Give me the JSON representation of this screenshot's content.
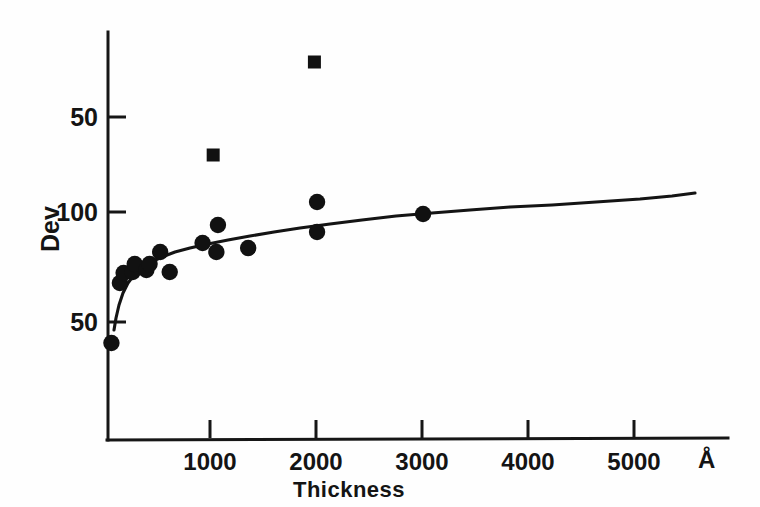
{
  "chart_data": {
    "type": "scatter",
    "title": "",
    "xlabel": "Thickness",
    "ylabel": "Dev",
    "xunit": "Å",
    "xlim": [
      0,
      5900
    ],
    "ylim_note": "Y axis tick labels read 50, 100, 50 from top to bottom as printed on the scanned figure",
    "grid": false,
    "legend": "none",
    "xticks": [
      1000,
      2000,
      3000,
      4000,
      5000
    ],
    "xtick_labels": [
      "1000",
      "2000",
      "3000",
      "4000",
      "5000"
    ],
    "yticks_labels": [
      "50",
      "100",
      "50"
    ],
    "ytick_positions_px": [
      117,
      212,
      322
    ],
    "series": [
      {
        "name": "circles",
        "marker": "circle",
        "color": "#111111",
        "points": [
          {
            "x": 70,
            "y_px": 343
          },
          {
            "x": 150,
            "y_px": 283
          },
          {
            "x": 185,
            "y_px": 273
          },
          {
            "x": 270,
            "y_px": 272
          },
          {
            "x": 290,
            "y_px": 264
          },
          {
            "x": 400,
            "y_px": 270
          },
          {
            "x": 430,
            "y_px": 264
          },
          {
            "x": 530,
            "y_px": 252
          },
          {
            "x": 620,
            "y_px": 272
          },
          {
            "x": 930,
            "y_px": 243
          },
          {
            "x": 1060,
            "y_px": 252
          },
          {
            "x": 1075,
            "y_px": 225
          },
          {
            "x": 1360,
            "y_px": 248
          },
          {
            "x": 2010,
            "y_px": 202
          },
          {
            "x": 2010,
            "y_px": 232
          },
          {
            "x": 3010,
            "y_px": 214
          }
        ]
      },
      {
        "name": "squares",
        "marker": "square",
        "color": "#111111",
        "points": [
          {
            "x": 1030,
            "y_px": 155
          },
          {
            "x": 1985,
            "y_px": 62
          }
        ]
      }
    ],
    "fit_curve": {
      "name": "fitted-curve",
      "color": "#141414",
      "description": "smooth monotonically rising saturating curve from lower-left to upper-right",
      "points_px": [
        [
          114,
          330
        ],
        [
          116,
          318
        ],
        [
          119,
          305
        ],
        [
          123,
          293
        ],
        [
          128,
          283
        ],
        [
          134,
          275
        ],
        [
          142,
          268
        ],
        [
          151,
          262
        ],
        [
          162,
          257
        ],
        [
          175,
          252
        ],
        [
          190,
          248
        ],
        [
          208,
          244
        ],
        [
          228,
          240
        ],
        [
          250,
          236
        ],
        [
          274,
          232
        ],
        [
          300,
          228
        ],
        [
          330,
          224
        ],
        [
          362,
          220
        ],
        [
          396,
          216
        ],
        [
          432,
          213
        ],
        [
          470,
          210
        ],
        [
          510,
          207
        ],
        [
          552,
          205
        ],
        [
          596,
          202
        ],
        [
          640,
          199
        ],
        [
          672,
          196
        ],
        [
          695,
          193
        ]
      ]
    }
  },
  "axes": {
    "y_tick_labels": [
      {
        "text": "50",
        "top": 103,
        "right": 98
      },
      {
        "text": "100",
        "top": 198,
        "right": 98
      },
      {
        "text": "50",
        "top": 308,
        "right": 98
      }
    ],
    "x_tick_labels": [
      {
        "text": "1000",
        "center": 210
      },
      {
        "text": "2000",
        "center": 316
      },
      {
        "text": "3000",
        "center": 422
      },
      {
        "text": "4000",
        "center": 528
      },
      {
        "text": "5000",
        "center": 634
      }
    ],
    "x_unit_symbol": "Å",
    "y_axis_title": "Dev",
    "x_axis_title": "Thickness"
  }
}
